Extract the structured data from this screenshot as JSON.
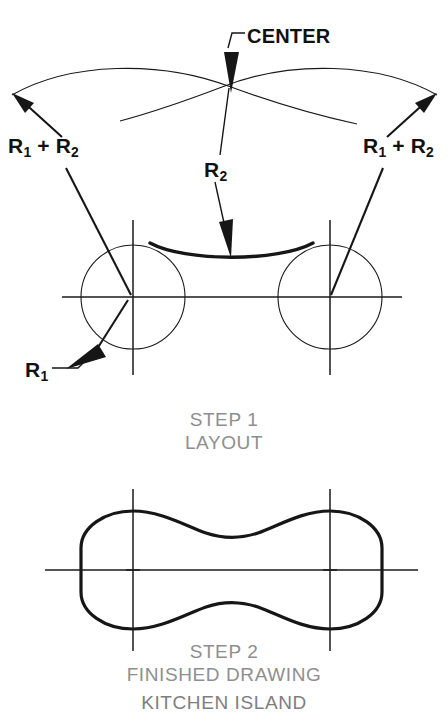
{
  "figure": {
    "title": "KITCHEN ISLAND",
    "step1": {
      "caption_line1": "STEP 1",
      "caption_line2": "LAYOUT",
      "labels": {
        "center": "CENTER",
        "left_sum": "R₁ + R₂",
        "right_sum": "R₁ + R₂",
        "r2": "R₂",
        "r1": "R₁"
      }
    },
    "step2": {
      "caption_line1": "STEP 2",
      "caption_line2": "FINISHED DRAWING"
    }
  },
  "label_parts": {
    "r_letter": "R",
    "sub_one": "1",
    "sub_two": "2",
    "plus": " + "
  },
  "colors": {
    "ink": "#161616",
    "thin_line": "#1a1a1a",
    "caption_gray": "#8e8e90",
    "title_gray": "#7e7e80",
    "background": "#ffffff"
  },
  "geometry": {
    "step1": {
      "left_circle": {
        "cx": 133,
        "cy": 297,
        "r": 52
      },
      "right_circle": {
        "cx": 330,
        "cy": 297,
        "r": 52
      },
      "center_point": {
        "x": 231,
        "y": 87
      },
      "horizontal_centerline_y": 297,
      "concave_arc_label": "R2 arc between circles"
    },
    "step2": {
      "centerline_y": 570,
      "left_center_x": 133,
      "right_center_x": 330,
      "shape_half_height": 60
    }
  }
}
